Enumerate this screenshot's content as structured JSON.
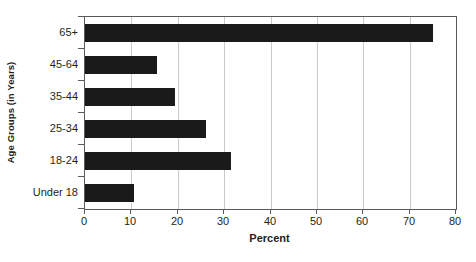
{
  "chart_data": {
    "type": "bar",
    "orientation": "horizontal",
    "title": "",
    "xlabel": "Percent",
    "ylabel": "Age Groups (in Years)",
    "categories": [
      "Under 18",
      "18-24",
      "25-34",
      "35-44",
      "45-64",
      "65+"
    ],
    "values": [
      10.5,
      31.5,
      26,
      19.5,
      15.5,
      75
    ],
    "xlim": [
      0,
      80
    ],
    "xticks": [
      0,
      10,
      20,
      30,
      40,
      50,
      60,
      70,
      80
    ],
    "xtick_labels": [
      "0",
      "10",
      "20",
      "30",
      "40",
      "50",
      "60",
      "70",
      "80"
    ],
    "grid": "vertical",
    "legend": "none",
    "bar_color": "#1a1a1a",
    "gridline_color": "#c9cacc",
    "axis_color": "#58595b"
  }
}
